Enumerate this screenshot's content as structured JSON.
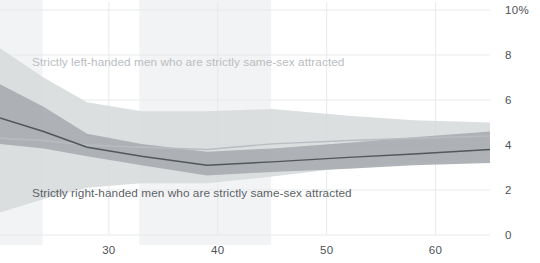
{
  "chart_data": {
    "type": "line",
    "title": "",
    "subtitle": "",
    "xlabel": "",
    "ylabel": "",
    "xlim": [
      20,
      65
    ],
    "ylim": [
      0,
      10
    ],
    "grid": true,
    "grid_axis": "both",
    "legend_position": "inline-annotation",
    "y_tick_labels": [
      "10%",
      "8",
      "6",
      "4",
      "2",
      "0"
    ],
    "y_tick_values": [
      10,
      8,
      6,
      4,
      2,
      0
    ],
    "x_tick_labels": [
      "30",
      "40",
      "50",
      "60"
    ],
    "x_tick_values": [
      30,
      40,
      50,
      60
    ],
    "y_unit": "percent",
    "x": [
      20,
      24,
      28,
      33,
      39,
      45,
      52,
      58,
      65
    ],
    "series": [
      {
        "name": "Strictly left-handed men who are strictly same-sex attracted",
        "color": "#b9bdc1",
        "band_color": "#d6d9db",
        "values": [
          4.3,
          4.2,
          4.0,
          3.9,
          3.8,
          4.05,
          4.2,
          4.3,
          4.4
        ],
        "band_upper": [
          8.3,
          7.0,
          5.9,
          5.5,
          5.5,
          5.6,
          5.3,
          5.1,
          5.0
        ],
        "band_lower": [
          1.0,
          1.6,
          2.1,
          2.3,
          2.3,
          2.6,
          3.0,
          3.2,
          3.4
        ]
      },
      {
        "name": "Strictly right-handed men who are strictly same-sex attracted",
        "color": "#52575c",
        "band_color": "#a9adb1",
        "values": [
          5.2,
          4.6,
          3.9,
          3.5,
          3.1,
          3.25,
          3.45,
          3.6,
          3.8
        ],
        "band_upper": [
          6.7,
          5.7,
          4.5,
          4.05,
          3.7,
          3.85,
          4.1,
          4.35,
          4.6
        ],
        "band_lower": [
          4.05,
          3.85,
          3.5,
          3.1,
          2.65,
          2.8,
          2.95,
          3.1,
          3.2
        ]
      }
    ],
    "background_shading": [
      {
        "name": "shaded-band-1",
        "x_start": 20,
        "x_end": 23.9,
        "color": "#f2f3f4"
      },
      {
        "name": "shaded-band-2",
        "x_start": 32.8,
        "x_end": 44.9,
        "color": "#f2f3f4"
      }
    ],
    "annotations": [
      {
        "name": "left-handed-series-label",
        "text": "Strictly left-handed men who are strictly same-sex attracted",
        "color": "#b9bdc1",
        "x_px": 32,
        "y_px": 66
      },
      {
        "name": "right-handed-series-label",
        "text": "Strictly right-handed men who are strictly same-sex attracted",
        "color": "#5d6266",
        "x_px": 32,
        "y_px": 197
      }
    ]
  },
  "axes": {
    "y_axis_title": "",
    "x_axis_title": ""
  },
  "colors": {
    "background": "#ffffff",
    "gridline": "#e7e9ea",
    "axis_text": "#4d5257",
    "left_line": "#b9bdc1",
    "left_band": "#d6d9db",
    "right_line": "#52575c",
    "right_band": "#a9adb1",
    "shading": "#f2f3f4"
  }
}
